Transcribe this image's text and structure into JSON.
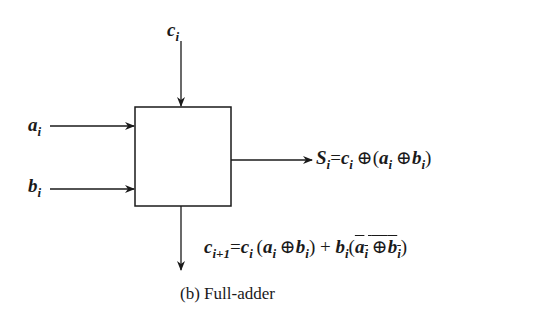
{
  "diagram": {
    "block": {
      "label": ""
    },
    "inputs": {
      "carry_in": {
        "var": "c",
        "sub": "i"
      },
      "a": {
        "var": "a",
        "sub": "i"
      },
      "b": {
        "var": "b",
        "sub": "i"
      }
    },
    "outputs": {
      "sum": {
        "lhs_var": "S",
        "lhs_sub": "i",
        "eq": "=",
        "t1_var": "c",
        "t1_sub": "i",
        "xor": "⊕",
        "lparen": "(",
        "t2_var": "a",
        "t2_sub": "i",
        "t3_var": "b",
        "t3_sub": "i",
        "rparen": ")"
      },
      "carry_out": {
        "lhs_var": "c",
        "lhs_sub": "i+1",
        "eq": "=",
        "t1_var": "c",
        "t1_sub": "i",
        "lparen": "(",
        "t2_var": "a",
        "t2_sub": "i",
        "xor": "⊕",
        "t3_var": "b",
        "t3_sub": "i",
        "rparen": ")",
        "plus": " + ",
        "t4_var": "b",
        "t4_sub": "i",
        "t5_var": "a",
        "t5_sub": "i",
        "t6_var": "b",
        "t6_sub": "i"
      }
    },
    "caption": "(b)  Full-adder"
  }
}
